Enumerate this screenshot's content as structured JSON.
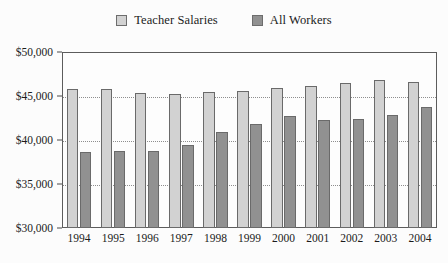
{
  "chart_data": {
    "type": "bar",
    "title": "",
    "xlabel": "",
    "ylabel": "",
    "categories": [
      "1994",
      "1995",
      "1996",
      "1997",
      "1998",
      "1999",
      "2000",
      "2001",
      "2002",
      "2003",
      "2004"
    ],
    "series": [
      {
        "name": "Teacher Salaries",
        "color": "#d2d2d2",
        "values": [
          45800,
          45800,
          45300,
          45200,
          45500,
          45600,
          45900,
          46100,
          46500,
          46800,
          46600
        ]
      },
      {
        "name": "All Workers",
        "color": "#919191",
        "values": [
          38600,
          38700,
          38800,
          39400,
          40900,
          41800,
          42700,
          42300,
          42400,
          42800,
          43700
        ]
      }
    ],
    "ylim": [
      30000,
      50000
    ],
    "ytick_values": [
      30000,
      35000,
      40000,
      45000,
      50000
    ],
    "ytick_labels": [
      "$30,000",
      "$35,000",
      "$40,000",
      "$45,000",
      "$50,000"
    ],
    "grid": true,
    "grid_axis": "y",
    "legend_position": "top-center"
  }
}
